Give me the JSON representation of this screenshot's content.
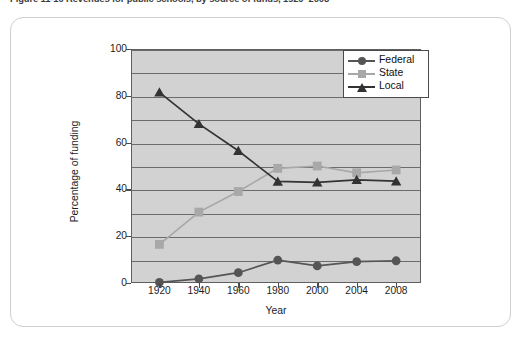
{
  "figure": {
    "caption": "Figure 11-10  Revenues for public schools, by source of funds, 1920–2008"
  },
  "chart_data": {
    "type": "line",
    "title": "",
    "xlabel": "Year",
    "ylabel": "Percentage of funding",
    "categories": [
      "1920",
      "1940",
      "1960",
      "1980",
      "2000",
      "2004",
      "2008"
    ],
    "xlim": [
      0,
      6
    ],
    "ylim": [
      0,
      100
    ],
    "yticks": [
      0,
      20,
      40,
      60,
      80,
      100
    ],
    "grid": true,
    "gridlines_minor": [
      10,
      30,
      50,
      70,
      90
    ],
    "legend_position": "top-right",
    "series": [
      {
        "name": "Federal",
        "marker": "circle",
        "color": "#555555",
        "values": [
          0.3,
          1.8,
          4.4,
          9.8,
          7.3,
          9.1,
          9.5
        ]
      },
      {
        "name": "State",
        "marker": "square",
        "color": "#a8a8a8",
        "values": [
          16.5,
          30.3,
          39.1,
          49.0,
          50.0,
          47.1,
          48.3
        ]
      },
      {
        "name": "Local",
        "marker": "triangle",
        "color": "#333333",
        "values": [
          81.5,
          68.0,
          56.5,
          43.4,
          43.0,
          44.1,
          43.5
        ]
      }
    ]
  }
}
